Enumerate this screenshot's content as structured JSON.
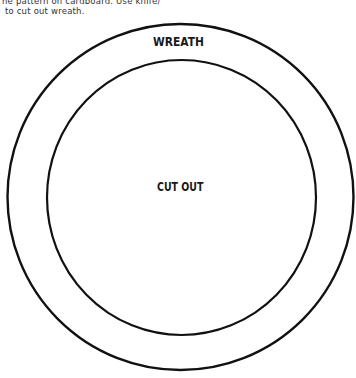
{
  "instructions": {
    "line1": "he pattern on cardboard. Use knife/",
    "line2": " to cut out wreath."
  },
  "pattern": {
    "outer_circle": {
      "cx": 180.5,
      "cy": 197,
      "r": 173,
      "stroke": "#111111"
    },
    "inner_circle": {
      "cx": 181.5,
      "cy": 197.5,
      "rx": 134.5,
      "ry": 137.5,
      "stroke": "#111111"
    },
    "ring_label": "WREATH",
    "center_label": "CUT OUT"
  }
}
